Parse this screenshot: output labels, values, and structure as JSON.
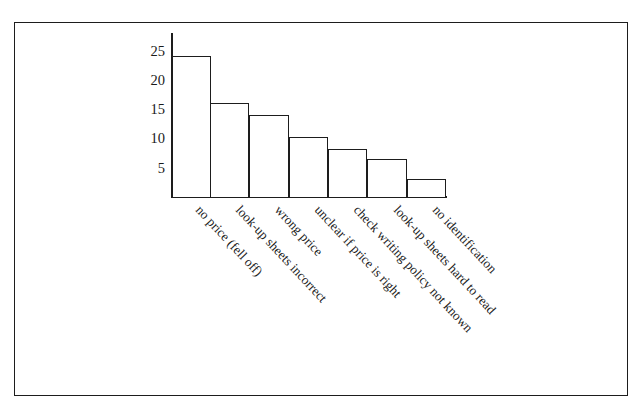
{
  "top_remnant": "",
  "chart_data": {
    "type": "bar",
    "title": "",
    "subtitle": "",
    "xlabel": "",
    "ylabel": "",
    "categories": [
      "no price (fell off)",
      "look-up sheets incorrect",
      "wrong price",
      "unclear if price is right",
      "check writing policy not known",
      "look-up sheets hard to read",
      "no identification"
    ],
    "values": [
      24,
      16,
      14,
      10.3,
      8.2,
      6.5,
      3
    ],
    "ylim": [
      0,
      28
    ],
    "yticks": [
      5,
      10,
      15,
      20,
      25
    ],
    "ytick_labels": [
      "25",
      "20",
      "15",
      "10",
      "5"
    ],
    "grid": false,
    "legend": "none",
    "bar_fill": "#ffffff",
    "bar_edge": "#1d1d1d",
    "axis_color": "#1d1d1d",
    "background": "#ffffff"
  }
}
